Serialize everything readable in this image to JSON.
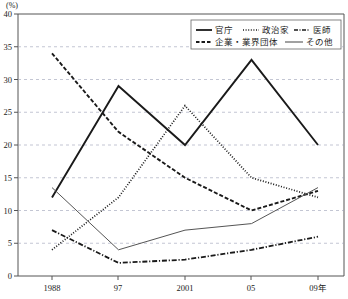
{
  "chart_data": {
    "type": "line",
    "title": "",
    "xlabel": "",
    "ylabel": "(%)",
    "unit": "(%)",
    "categories": [
      "1988",
      "97",
      "2001",
      "05",
      "09年"
    ],
    "x_tick_labels": [
      "1988",
      "97",
      "2001",
      "05",
      "09年"
    ],
    "y_tick_labels": [
      "0",
      "5",
      "10",
      "15",
      "20",
      "25",
      "30",
      "35",
      "40"
    ],
    "ylim": [
      0,
      40
    ],
    "y_step": 5,
    "grid": true,
    "grid_style": "dashed-horizontal",
    "legend_position": "top-right",
    "series": [
      {
        "name": "官庁",
        "style": "solid",
        "color": "#1a1a1a",
        "values": [
          12,
          29,
          20,
          33,
          20
        ]
      },
      {
        "name": "政治家",
        "style": "dotted",
        "color": "#1a1a1a",
        "values": [
          4,
          12,
          26,
          15,
          12
        ]
      },
      {
        "name": "医師",
        "style": "dash-dot",
        "color": "#1a1a1a",
        "values": [
          7,
          2,
          2.5,
          4,
          6
        ]
      },
      {
        "name": "企業・業界団体",
        "style": "dashed",
        "color": "#1a1a1a",
        "values": [
          34,
          22,
          15,
          10,
          13
        ]
      },
      {
        "name": "その他",
        "style": "thin-solid",
        "color": "#555555",
        "values": [
          13.5,
          4,
          7,
          8,
          13.5
        ]
      }
    ]
  },
  "legend": {
    "rows": [
      [
        "官庁",
        "政治家",
        "医師"
      ],
      [
        "企業・業界団体",
        "その他"
      ]
    ]
  },
  "axis": {
    "unit": "(%)"
  }
}
